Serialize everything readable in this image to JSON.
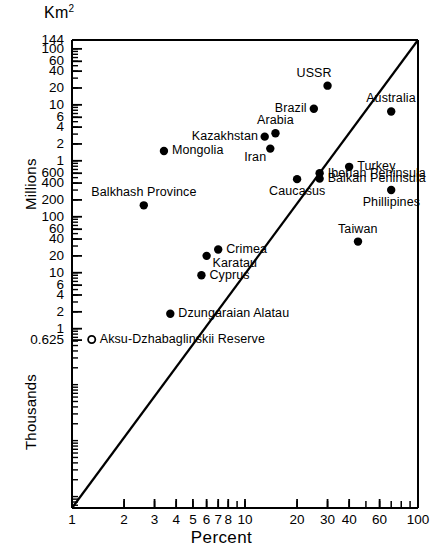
{
  "chart_data": {
    "type": "scatter",
    "title": "",
    "xlabel": "Percent",
    "ylabel": "Km2",
    "ylabel_segments": [
      "Millions",
      "Thousands"
    ],
    "y_unit_top": "Km",
    "y_unit_sup": "2",
    "xscale": "log",
    "yscale": "log",
    "xlim": [
      1,
      100
    ],
    "ylim": [
      0.625,
      144000000
    ],
    "grid": false,
    "legend": "none",
    "xticks": [
      1,
      2,
      3,
      4,
      5,
      6,
      7,
      8,
      10,
      20,
      30,
      40,
      60,
      100
    ],
    "xtick_labels": [
      "1",
      "2",
      "3",
      "4",
      "5",
      "6",
      "7",
      "8",
      "10",
      "20",
      "30",
      "40",
      "60",
      "100"
    ],
    "yticks": [
      144000000,
      100000000,
      60000000,
      40000000,
      20000000,
      10000000,
      6000000,
      4000000,
      2000000,
      1000000,
      600000,
      400000,
      200000,
      100000,
      60000,
      40000,
      20000,
      10000,
      6000,
      4000,
      2000,
      1000,
      625
    ],
    "ytick_labels": [
      "144",
      "100",
      "60",
      "40",
      "20",
      "10",
      "6",
      "4",
      "2",
      "1",
      "600",
      "400",
      "200",
      "100",
      "60",
      "40",
      "20",
      "10",
      "6",
      "4",
      "2",
      "1",
      "0.625"
    ],
    "reference_line": {
      "description": "diagonal reference line",
      "from": [
        1,
        0.625
      ],
      "to": [
        100,
        144000000
      ]
    },
    "points": [
      {
        "name": "USSR",
        "x": 30,
        "y": 22000000,
        "label": "USSR",
        "label_pos": "above-left",
        "marker": "filled"
      },
      {
        "name": "Brazil",
        "x": 25,
        "y": 8500000,
        "label": "Brazil",
        "label_pos": "left",
        "marker": "filled"
      },
      {
        "name": "Australia",
        "x": 70,
        "y": 7600000,
        "label": "Australia",
        "label_pos": "above",
        "marker": "filled"
      },
      {
        "name": "Arabia",
        "x": 15,
        "y": 3100000,
        "label": "Arabia",
        "label_pos": "above",
        "marker": "filled"
      },
      {
        "name": "Kazakhstan",
        "x": 13,
        "y": 2700000,
        "label": "Kazakhstan",
        "label_pos": "left",
        "marker": "filled"
      },
      {
        "name": "Iran",
        "x": 14,
        "y": 1650000,
        "label": "Iran",
        "label_pos": "below-left",
        "marker": "filled"
      },
      {
        "name": "Mongolia",
        "x": 3.4,
        "y": 1500000,
        "label": "Mongolia",
        "label_pos": "right",
        "marker": "filled"
      },
      {
        "name": "Turkey",
        "x": 40,
        "y": 780000,
        "label": "Turkey",
        "label_pos": "right",
        "marker": "filled"
      },
      {
        "name": "Iberian Peninsula",
        "x": 27,
        "y": 600000,
        "label": "Iberian Peninsula",
        "label_pos": "right",
        "marker": "filled"
      },
      {
        "name": "Balkan Peninsula",
        "x": 27,
        "y": 480000,
        "label": "Balkan Peninsula",
        "label_pos": "right",
        "marker": "filled"
      },
      {
        "name": "Caucasus",
        "x": 20,
        "y": 470000,
        "label": "Caucasus",
        "label_pos": "below",
        "marker": "filled"
      },
      {
        "name": "Phillipines",
        "x": 70,
        "y": 300000,
        "label": "Phillipines",
        "label_pos": "below",
        "marker": "filled"
      },
      {
        "name": "Balkhash Province",
        "x": 2.6,
        "y": 160000,
        "label": "Balkhash Province",
        "label_pos": "above",
        "marker": "filled"
      },
      {
        "name": "Taiwan",
        "x": 45,
        "y": 36000,
        "label": "Taiwan",
        "label_pos": "above",
        "marker": "filled"
      },
      {
        "name": "Crimea",
        "x": 7,
        "y": 26000,
        "label": "Crimea",
        "label_pos": "right",
        "marker": "filled"
      },
      {
        "name": "Karatau",
        "x": 6,
        "y": 20000,
        "label": "Karatau",
        "label_pos": "below-right",
        "marker": "filled"
      },
      {
        "name": "Cyprus",
        "x": 5.6,
        "y": 9000,
        "label": "Cyprus",
        "label_pos": "right",
        "marker": "filled"
      },
      {
        "name": "Dzungaraian Alatau",
        "x": 3.7,
        "y": 1850,
        "label": "Dzungaraian Alatau",
        "label_pos": "right",
        "marker": "filled"
      },
      {
        "name": "Aksu-Dzhabaglinskii Reserve",
        "x": 1.3,
        "y": 640,
        "label": "Aksu-Dzhabaglinskii Reserve",
        "label_pos": "right",
        "marker": "open"
      }
    ],
    "colors": {
      "axis": "#000000",
      "marker": "#000000",
      "line": "#000000",
      "background": "#ffffff"
    }
  }
}
